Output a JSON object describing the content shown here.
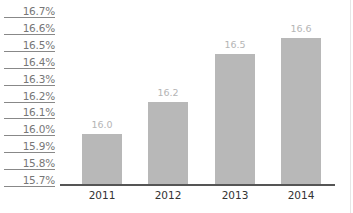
{
  "chart_data": {
    "type": "bar",
    "title": "",
    "xlabel": "",
    "ylabel": "",
    "categories": [
      "2011",
      "2012",
      "2013",
      "2014"
    ],
    "values": [
      16.0,
      16.2,
      16.5,
      16.6
    ],
    "data_labels": [
      "16.0",
      "16.2",
      "16.5",
      "16.6"
    ],
    "y_ticks": [
      "16.7%",
      "16.6%",
      "16.5%",
      "16.4%",
      "16.3%",
      "16.2%",
      "16.1%",
      "16.0%",
      "15.9%",
      "15.8%",
      "15.7%"
    ],
    "ylim": [
      15.7,
      16.7
    ],
    "grid": false,
    "legend": null,
    "colors": {
      "bar": "#b8b8b8",
      "data_label": "#b5b5b5",
      "axis": "#555555",
      "tick_text": "#777777"
    }
  }
}
